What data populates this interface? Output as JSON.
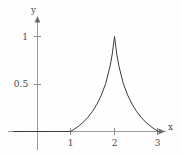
{
  "chart_data": {
    "type": "line",
    "title": "",
    "xlabel": "x",
    "ylabel": "y",
    "xlim": [
      -0.35,
      3.35
    ],
    "ylim": [
      -0.12,
      1.18
    ],
    "x_ticks": [
      1,
      2,
      3
    ],
    "x_tick_labels": [
      "1",
      "2",
      "3"
    ],
    "y_ticks": [
      0.5,
      1
    ],
    "y_tick_labels": [
      "0.5",
      "1"
    ],
    "grid": false,
    "legend": "none",
    "axes_arrows": true,
    "curve_color": "#3a3a3a",
    "axis_color": "#9a9a9a",
    "series": [
      {
        "name": "f(x)",
        "description": "zero for x<=1, exponential-like rise to a cusp peak of 1 at x=2, exponential-like decay to 0 at x=3",
        "x": [
          -0.3,
          0.0,
          0.25,
          0.5,
          0.75,
          1.0,
          1.1,
          1.2,
          1.3,
          1.4,
          1.5,
          1.6,
          1.7,
          1.8,
          1.9,
          1.95,
          2.0,
          2.05,
          2.1,
          2.2,
          2.3,
          2.4,
          2.5,
          2.6,
          2.7,
          2.8,
          2.9,
          3.0
        ],
        "y": [
          0.0,
          0.0,
          0.0,
          0.0,
          0.0,
          0.0,
          0.028,
          0.062,
          0.102,
          0.152,
          0.212,
          0.287,
          0.382,
          0.505,
          0.688,
          0.818,
          1.0,
          0.818,
          0.688,
          0.505,
          0.382,
          0.287,
          0.212,
          0.152,
          0.102,
          0.062,
          0.028,
          0.0
        ]
      }
    ]
  },
  "axes": {
    "x_axis_label": "x",
    "y_axis_label": "y",
    "x_tick_1": "1",
    "x_tick_2": "2",
    "x_tick_3": "3",
    "y_tick_half": "0.5",
    "y_tick_one": "1"
  }
}
